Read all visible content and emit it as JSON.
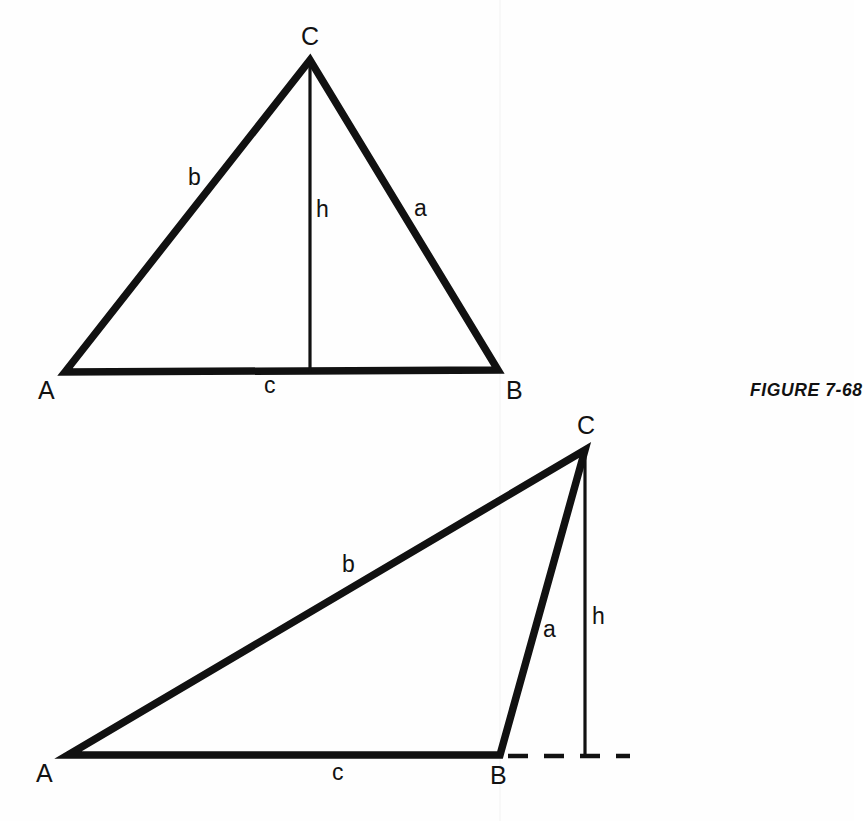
{
  "figure": {
    "caption": "FIGURE 7-68",
    "caption_position": {
      "x": 750,
      "y": 380
    }
  },
  "diagrams": [
    {
      "name": "acute-triangle",
      "type": "triangle-with-altitude",
      "description": "Acute triangle ABC with altitude h drawn from vertex C to base AB (foot inside the base)",
      "vertices": [
        {
          "label": "A",
          "x": 65,
          "y": 372,
          "label_x": 38,
          "label_y": 390
        },
        {
          "label": "B",
          "x": 498,
          "y": 370,
          "label_x": 506,
          "label_y": 390
        },
        {
          "label": "C",
          "x": 310,
          "y": 60,
          "label_x": 302,
          "label_y": 30
        }
      ],
      "sides": [
        {
          "label": "a",
          "from": "B",
          "to": "C",
          "label_x": 413,
          "label_y": 200
        },
        {
          "label": "b",
          "from": "A",
          "to": "C",
          "label_x": 188,
          "label_y": 168
        },
        {
          "label": "c",
          "from": "A",
          "to": "B",
          "label_x": 264,
          "label_y": 375
        }
      ],
      "altitude": {
        "label": "h",
        "from_x": 310,
        "from_y": 60,
        "to_x": 310,
        "to_y": 371,
        "label_x": 316,
        "label_y": 200,
        "foot_inside_base": true
      }
    },
    {
      "name": "obtuse-triangle",
      "type": "triangle-with-external-altitude",
      "description": "Obtuse triangle ABC with altitude h from vertex C falling outside segment AB, base extended with a dashed line",
      "vertices": [
        {
          "label": "A",
          "x": 68,
          "y": 755,
          "label_x": 38,
          "label_y": 773
        },
        {
          "label": "B",
          "x": 500,
          "y": 755,
          "label_x": 492,
          "label_y": 775
        },
        {
          "label": "C",
          "x": 585,
          "y": 450,
          "label_x": 578,
          "label_y": 418
        }
      ],
      "sides": [
        {
          "label": "a",
          "from": "B",
          "to": "C",
          "label_x": 543,
          "label_y": 620
        },
        {
          "label": "b",
          "from": "A",
          "to": "C",
          "label_x": 342,
          "label_y": 556
        },
        {
          "label": "c",
          "from": "A",
          "to": "B",
          "label_x": 332,
          "label_y": 762
        }
      ],
      "altitude": {
        "label": "h",
        "from_x": 585,
        "from_y": 450,
        "to_x": 585,
        "to_y": 756,
        "label_x": 592,
        "label_y": 608,
        "foot_inside_base": false
      },
      "base_extension": {
        "style": "dashed",
        "from_x": 505,
        "from_y": 756,
        "to_x": 630,
        "to_y": 756
      }
    }
  ],
  "colors": {
    "ink": "#111111",
    "paper": "#fefefe"
  }
}
